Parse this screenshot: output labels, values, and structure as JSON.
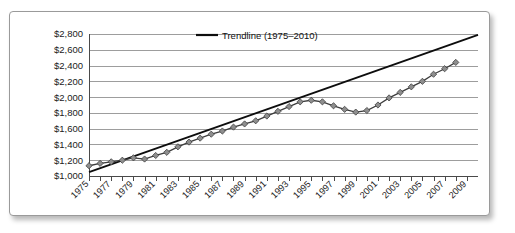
{
  "chart_data": {
    "type": "line",
    "title": "",
    "subtitle": "",
    "xlabel": "",
    "ylabel": "",
    "xlim": [
      1975,
      2010
    ],
    "ylim": [
      1000,
      2800
    ],
    "y_tick_step": 200,
    "grid": true,
    "legend_position": "top-center",
    "y_tick_labels": [
      "$1,000",
      "$1,200",
      "$1,400",
      "$1,600",
      "$1,800",
      "$2,000",
      "$2,200",
      "$2,400",
      "$2,600",
      "$2,800"
    ],
    "y_tick_values": [
      1000,
      1200,
      1400,
      1600,
      1800,
      2000,
      2200,
      2400,
      2600,
      2800
    ],
    "x_tick_labels": [
      "1975",
      "1977",
      "1979",
      "1981",
      "1983",
      "1985",
      "1987",
      "1989",
      "1991",
      "1993",
      "1995",
      "1997",
      "1999",
      "2001",
      "2003",
      "2005",
      "2007",
      "2009"
    ],
    "x_tick_values": [
      1975,
      1977,
      1979,
      1981,
      1983,
      1985,
      1987,
      1989,
      1991,
      1993,
      1995,
      1997,
      1999,
      2001,
      2003,
      2005,
      2007,
      2009
    ],
    "x_minor_values": [
      1976,
      1978,
      1980,
      1982,
      1984,
      1986,
      1988,
      1990,
      1992,
      1994,
      1996,
      1998,
      2000,
      2002,
      2004,
      2006,
      2008
    ],
    "legend": [
      {
        "label": "Trendline (1975–2010)",
        "marker": "line",
        "color": "#0d0d0d"
      }
    ],
    "series": [
      {
        "name": "Data",
        "marker": "diamond",
        "color": "#8e8e8e",
        "line_color": "#3d3d3d",
        "x": [
          1975,
          1976,
          1977,
          1978,
          1979,
          1980,
          1981,
          1982,
          1983,
          1984,
          1985,
          1986,
          1987,
          1988,
          1989,
          1990,
          1991,
          1992,
          1993,
          1994,
          1995,
          1996,
          1997,
          1998,
          1999,
          2000,
          2001,
          2002,
          2003,
          2004,
          2005,
          2006,
          2007,
          2008
        ],
        "values": [
          1130,
          1160,
          1180,
          1200,
          1230,
          1215,
          1260,
          1300,
          1370,
          1430,
          1480,
          1530,
          1570,
          1620,
          1660,
          1700,
          1760,
          1820,
          1880,
          1940,
          1960,
          1940,
          1890,
          1845,
          1810,
          1830,
          1900,
          1990,
          2060,
          2130,
          2200,
          2290,
          2360,
          2440
        ]
      },
      {
        "name": "Trendline",
        "marker": "line",
        "color": "#0d0d0d",
        "x": [
          1975,
          2010
        ],
        "values": [
          1050,
          2790
        ]
      }
    ],
    "annotations": []
  },
  "legend_entry_label": "Trendline (1975–2010)"
}
